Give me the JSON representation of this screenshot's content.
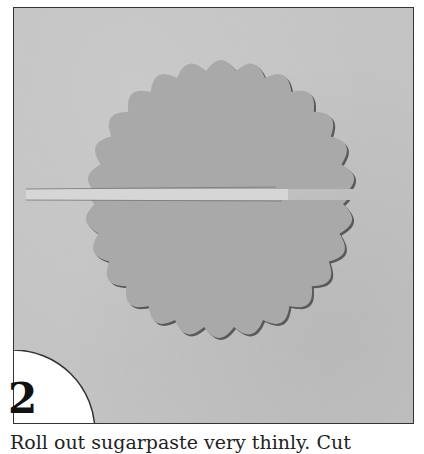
{
  "figure": {
    "step_number": "2",
    "caption": "Roll out sugarpaste very thinly. Cut",
    "photo": {
      "description": "Scalloped circle of grey sugarpaste cut in half with a thin strip removed across the middle",
      "background_color": "#c4c4c4",
      "disc_color": "#a9a9a9",
      "strip_color": "#d6d6d6",
      "border_color": "#333333"
    }
  }
}
